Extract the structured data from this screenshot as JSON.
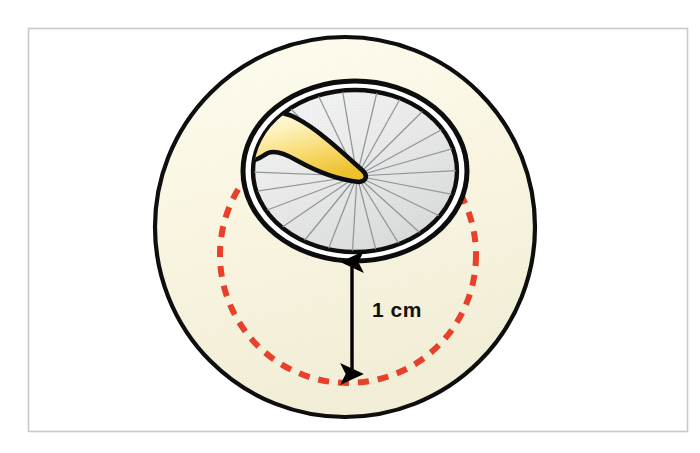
{
  "figure": {
    "background_color": "#ffffff",
    "frame": {
      "stroke_color": "#c9c9c9",
      "x": 28,
      "y": 28,
      "width": 660,
      "height": 404
    }
  },
  "annotations": {
    "scale_label": "1 cm",
    "scale_label_color": "#111111"
  },
  "shapes": {
    "outer_oval": {
      "name": "peripapillary-atrophy-zone",
      "fill": "#faf6e3",
      "stroke": "#000000",
      "stroke_width": 4,
      "cx": 345,
      "cy": 227,
      "rx": 190,
      "ry": 190
    },
    "inner_ring_outer": {
      "name": "optic-disc-outer-ring",
      "fill": "#ffffff",
      "stroke": "#000000",
      "stroke_width": 5,
      "cx": 355,
      "cy": 171,
      "rx": 112,
      "ry": 90
    },
    "inner_ring_inner": {
      "name": "optic-disc-inner-ring",
      "fill": "#e9ebea",
      "stroke": "#000000",
      "stroke_width": 4,
      "cx": 355,
      "cy": 171,
      "rx": 103,
      "ry": 82
    },
    "dashed_circle": {
      "name": "one-centimeter-reference-circle",
      "stroke": "#e8402a",
      "stroke_width": 6,
      "dash": "11 9",
      "cx": 348,
      "cy": 255,
      "r": 128
    },
    "margin_arc": {
      "name": "disc-margin-highlight-arc",
      "magenta": "#c61ec0",
      "green": "#35b54a"
    },
    "vessel": {
      "name": "retinal-vessel-bundle",
      "fill_light": "#fdf4c8",
      "fill_dark": "#f2c93f",
      "stroke": "#000000"
    },
    "nerve_fiber_lines": {
      "name": "radiating-nerve-fiber-lines",
      "stroke": "#8c9196",
      "count": 22,
      "hub_x": 357,
      "hub_y": 176
    },
    "measure_arrow": {
      "name": "one-centimeter-measure-arrow",
      "stroke": "#000000",
      "x": 352,
      "y_top": 256,
      "y_bottom": 380
    }
  }
}
